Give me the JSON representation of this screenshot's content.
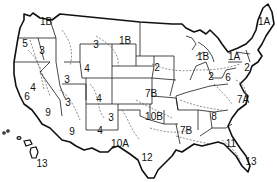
{
  "map": {
    "title": "US zone map",
    "zones": [
      {
        "id": "1B-northwest",
        "label": "1B",
        "x": 46,
        "y": 22
      },
      {
        "id": "1B-north",
        "label": "1B",
        "x": 125,
        "y": 41
      },
      {
        "id": "1B-michigan",
        "label": "1B",
        "x": 203,
        "y": 57
      },
      {
        "id": "1A-maine",
        "label": "1A",
        "x": 264,
        "y": 22
      },
      {
        "id": "1A-newyork",
        "label": "1A",
        "x": 234,
        "y": 57
      },
      {
        "id": "2-plains",
        "label": "2",
        "x": 157,
        "y": 68
      },
      {
        "id": "2-ohio",
        "label": "2",
        "x": 211,
        "y": 77
      },
      {
        "id": "2-newjersey",
        "label": "2",
        "x": 247,
        "y": 68
      },
      {
        "id": "3-idaho",
        "label": "3",
        "x": 96,
        "y": 45
      },
      {
        "id": "3-oregon",
        "label": "3",
        "x": 42,
        "y": 51
      },
      {
        "id": "3-nevada",
        "label": "3",
        "x": 67,
        "y": 80
      },
      {
        "id": "3-utah",
        "label": "3",
        "x": 68,
        "y": 103
      },
      {
        "id": "3-newmexico",
        "label": "3",
        "x": 111,
        "y": 118
      },
      {
        "id": "4-wyoming",
        "label": "4",
        "x": 87,
        "y": 69
      },
      {
        "id": "4-california",
        "label": "4",
        "x": 33,
        "y": 88
      },
      {
        "id": "4-colorado",
        "label": "4",
        "x": 99,
        "y": 99
      },
      {
        "id": "4-newmexico",
        "label": "4",
        "x": 100,
        "y": 131
      },
      {
        "id": "5-coast",
        "label": "5",
        "x": 25,
        "y": 44
      },
      {
        "id": "6-california",
        "label": "6",
        "x": 27,
        "y": 97
      },
      {
        "id": "6-virginia",
        "label": "6",
        "x": 228,
        "y": 78
      },
      {
        "id": "7A-carolina",
        "label": "7A",
        "x": 243,
        "y": 100
      },
      {
        "id": "7B-kansas",
        "label": "7B",
        "x": 151,
        "y": 94
      },
      {
        "id": "7B-south",
        "label": "7B",
        "x": 186,
        "y": 131
      },
      {
        "id": "8-georgia",
        "label": "8",
        "x": 214,
        "y": 117
      },
      {
        "id": "9-socal",
        "label": "9",
        "x": 48,
        "y": 113
      },
      {
        "id": "9-arizona",
        "label": "9",
        "x": 72,
        "y": 132
      },
      {
        "id": "10A-texas",
        "label": "10A",
        "x": 120,
        "y": 144
      },
      {
        "id": "10B-oklahoma",
        "label": "10B",
        "x": 154,
        "y": 117
      },
      {
        "id": "11-florida",
        "label": "11",
        "x": 231,
        "y": 144
      },
      {
        "id": "12-texas",
        "label": "12",
        "x": 147,
        "y": 158
      },
      {
        "id": "13-florida",
        "label": "13",
        "x": 251,
        "y": 162
      },
      {
        "id": "13-hawaii",
        "label": "13",
        "x": 42,
        "y": 164
      }
    ]
  }
}
